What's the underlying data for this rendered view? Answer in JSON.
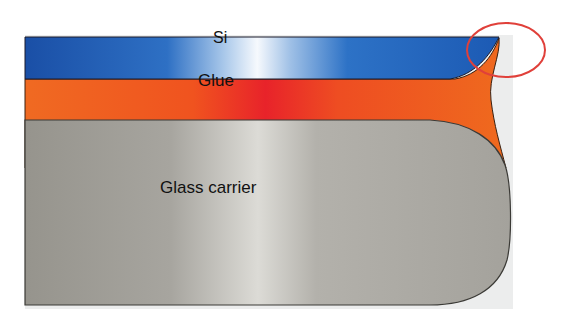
{
  "diagram": {
    "type": "cross-section",
    "layers": [
      {
        "name": "Si",
        "label": "Si",
        "color": "#1b5fb8",
        "highlight": "#f4f8fd"
      },
      {
        "name": "Glue",
        "label": "Glue",
        "color": "#f0621c",
        "highlight": "#ea2226"
      },
      {
        "name": "Glass carrier",
        "label": "Glass carrier",
        "color": "#9d9b94",
        "highlight": "#d8d7d2"
      }
    ],
    "annotations": [
      {
        "type": "circle",
        "color": "#e0403a",
        "target": "edge-fillet"
      }
    ]
  }
}
